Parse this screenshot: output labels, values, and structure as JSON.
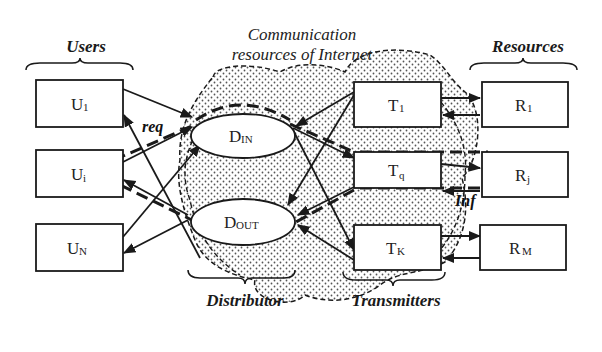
{
  "diagram": {
    "title": "Communication resources of Internet",
    "title_line1": "Communication",
    "title_line2": "resources of Internet",
    "groups": {
      "users": "Users",
      "resources": "Resources",
      "distributor": "Distributor",
      "transmitters": "Transmitters"
    },
    "users": [
      {
        "main": "U",
        "sub": "1"
      },
      {
        "main": "U",
        "sub": "i"
      },
      {
        "main": "U",
        "sub": "N"
      }
    ],
    "distributor_nodes": [
      {
        "main": "D",
        "sub": "IN"
      },
      {
        "main": "D",
        "sub": "OUT"
      }
    ],
    "transmitters": [
      {
        "main": "T",
        "sub": "1"
      },
      {
        "main": "T",
        "sub": "q"
      },
      {
        "main": "T",
        "sub": "K"
      }
    ],
    "resources": [
      {
        "main": "R",
        "sub": "1"
      },
      {
        "main": "R",
        "sub": "j"
      },
      {
        "main": "R",
        "sub": "M"
      }
    ],
    "flow_labels": {
      "request": "req",
      "information": "Inf"
    },
    "colors": {
      "line": "#1a1a1a",
      "cloud_dot": "#555555",
      "background": "#ffffff"
    }
  }
}
